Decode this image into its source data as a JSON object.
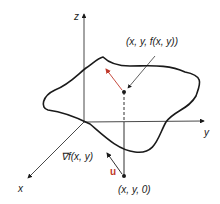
{
  "diagram": {
    "axes": {
      "z_label": "z",
      "y_label": "y",
      "x_label": "x"
    },
    "labels": {
      "surface_point": "(x, y,  f(x, y))",
      "base_point": "(x, y, 0)",
      "gradient": "∇f(x, y)",
      "unit_vector": "u"
    },
    "colors": {
      "line": "#1a1a1a",
      "accent": "#c0392b"
    }
  }
}
